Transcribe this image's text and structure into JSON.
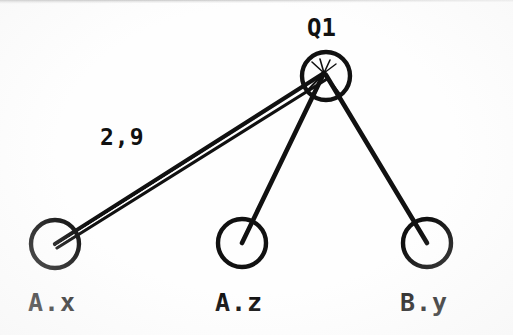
{
  "diagram": {
    "type": "node-link-graph",
    "title": "",
    "background_color": "#fefefe",
    "stroke_color": "#111111",
    "nodes": [
      {
        "id": "q1",
        "label": "Q1",
        "cx": 326,
        "cy": 76,
        "r": 24,
        "label_position": "above"
      },
      {
        "id": "ax",
        "label": "A.x",
        "cx": 55,
        "cy": 244,
        "r": 24,
        "label_position": "below"
      },
      {
        "id": "az",
        "label": "A.z",
        "cx": 242,
        "cy": 243,
        "r": 24,
        "label_position": "below"
      },
      {
        "id": "by",
        "label": "B.y",
        "cx": 427,
        "cy": 243,
        "r": 24,
        "label_position": "below"
      }
    ],
    "edges": [
      {
        "id": "e-ax-q1",
        "from": "ax",
        "to": "q1",
        "label": "2,9",
        "style": "double-line"
      },
      {
        "id": "e-az-q1",
        "from": "az",
        "to": "q1",
        "label": "",
        "style": "single-line"
      },
      {
        "id": "e-by-q1",
        "from": "by",
        "to": "q1",
        "label": "",
        "style": "single-line"
      }
    ],
    "convergence_point": {
      "x": 324,
      "y": 73
    },
    "edge_labels": [
      {
        "id": "lbl-2-9",
        "text": "2,9",
        "x": 100,
        "y": 124
      }
    ]
  }
}
